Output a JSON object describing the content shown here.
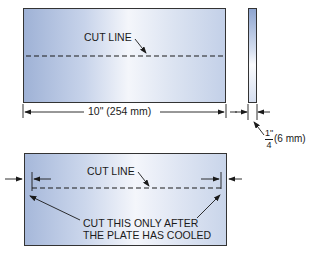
{
  "top_view": {
    "cut_line_label": "CUT LINE",
    "width_dimension": "10\" (254 mm)"
  },
  "edge_view": {
    "thickness_numerator": "1\"",
    "thickness_denominator": "4",
    "thickness_metric": "(6 mm)"
  },
  "bottom_view": {
    "cut_line_label": "CUT LINE",
    "note_line1": "CUT THIS ONLY AFTER",
    "note_line2": "THE PLATE HAS COOLED"
  },
  "colors": {
    "plate_dark": "#9fb2d6",
    "plate_light": "#f4f6fb",
    "line": "#1a1a1a"
  }
}
